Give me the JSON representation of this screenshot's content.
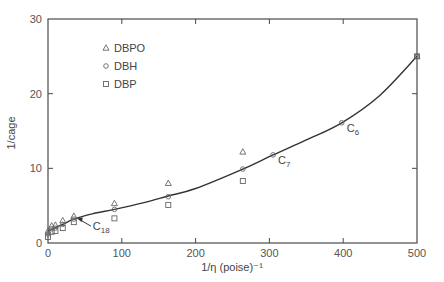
{
  "chart_data": {
    "type": "scatter",
    "title": "",
    "xlabel": "1/η (poise)⁻¹",
    "ylabel": "1/cage",
    "xlim": [
      0,
      500
    ],
    "ylim": [
      0,
      30
    ],
    "x_ticks": [
      0,
      100,
      200,
      300,
      400,
      500
    ],
    "y_ticks": [
      0,
      10,
      20,
      30
    ],
    "grid": false,
    "legend_position": "top-left",
    "series": [
      {
        "name": "DBPO",
        "marker": "triangle",
        "x": [
          0,
          5,
          10,
          20,
          35,
          90,
          163,
          264,
          500
        ],
        "y": [
          1.6,
          2.3,
          2.4,
          3.0,
          3.6,
          5.3,
          8.0,
          12.2,
          25.0
        ]
      },
      {
        "name": "DBH",
        "marker": "circle",
        "x": [
          0,
          5,
          10,
          20,
          35,
          90,
          163,
          264,
          305,
          398,
          500
        ],
        "y": [
          1.2,
          1.9,
          2.0,
          2.5,
          3.2,
          4.5,
          6.2,
          9.9,
          11.8,
          16.1,
          25.0
        ]
      },
      {
        "name": "DBP",
        "marker": "square",
        "x": [
          0,
          5,
          10,
          20,
          35,
          90,
          163,
          264,
          500
        ],
        "y": [
          0.8,
          1.5,
          1.6,
          2.0,
          2.8,
          3.3,
          5.1,
          8.3,
          25.0
        ]
      }
    ],
    "fit_curve": {
      "name": "fit",
      "x": [
        0,
        20,
        35,
        60,
        90,
        130,
        163,
        200,
        264,
        305,
        350,
        398,
        450,
        500
      ],
      "y": [
        1.6,
        2.5,
        3.2,
        3.9,
        4.5,
        5.4,
        6.3,
        7.3,
        9.9,
        11.8,
        13.8,
        16.1,
        19.8,
        25.0
      ]
    },
    "annotations": [
      {
        "label": "C",
        "sub": "18",
        "x": 35,
        "y": 3.2,
        "arrow": true
      },
      {
        "label": "C",
        "sub": "7",
        "x": 305,
        "y": 11.8,
        "arrow": false
      },
      {
        "label": "C",
        "sub": "6",
        "x": 398,
        "y": 16.1,
        "arrow": false
      }
    ]
  }
}
